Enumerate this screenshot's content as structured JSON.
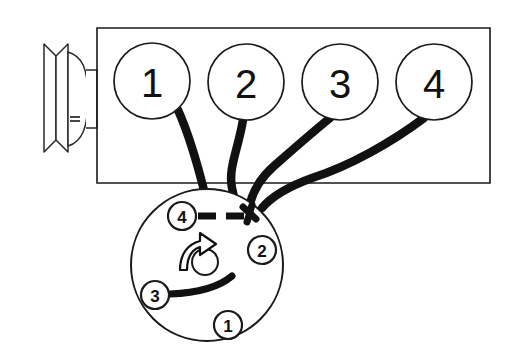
{
  "diagram": {
    "title": "Engine firing order and distributor wiring diagram",
    "background_color": "#ffffff",
    "line_color": "#1a1a1a",
    "wire_color": "#111111",
    "engine_block": {
      "label": "engine-block",
      "front_pulley_label": "crankshaft-pulley"
    },
    "cylinders": [
      {
        "label": "1",
        "cx": 152,
        "cy": 81,
        "r": 38
      },
      {
        "label": "2",
        "cx": 246,
        "cy": 82,
        "r": 38
      },
      {
        "label": "3",
        "cx": 340,
        "cy": 82,
        "r": 38
      },
      {
        "label": "4",
        "cx": 434,
        "cy": 82,
        "r": 38
      }
    ],
    "distributor": {
      "label": "distributor-cap",
      "cx": 207,
      "cy": 265,
      "r": 76,
      "rotation_direction": "counterclockwise",
      "rotation_arrow_label": "rotor-rotation-arrow",
      "center_hole_label": "rotor-center-hole",
      "terminals": [
        {
          "label": "1",
          "cx": 228,
          "cy": 325,
          "r": 14
        },
        {
          "label": "2",
          "cx": 262,
          "cy": 250,
          "r": 14
        },
        {
          "label": "3",
          "cx": 155,
          "cy": 295,
          "r": 14
        },
        {
          "label": "4",
          "cx": 182,
          "cy": 216,
          "r": 14
        }
      ]
    },
    "wires": [
      {
        "from_cylinder": "1",
        "to_terminal": "1"
      },
      {
        "from_cylinder": "2",
        "to_terminal": "2"
      },
      {
        "from_cylinder": "3",
        "to_terminal": "3"
      },
      {
        "from_cylinder": "4",
        "to_terminal": "4"
      }
    ]
  }
}
